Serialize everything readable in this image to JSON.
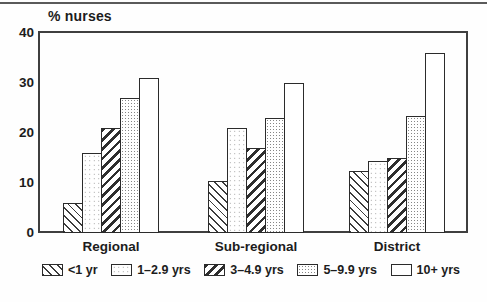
{
  "chart_data": {
    "type": "bar",
    "title": "% nurses",
    "ylabel": "% nurses",
    "xlabel": "",
    "ylim": [
      0,
      40
    ],
    "yticks": [
      0,
      10,
      20,
      30,
      40
    ],
    "grid": false,
    "legend_position": "bottom",
    "categories": [
      "Regional",
      "Sub-regional",
      "District"
    ],
    "series": [
      {
        "name": "<1 yr",
        "pattern": "hatch-back",
        "values": [
          6,
          10.5,
          12.5
        ]
      },
      {
        "name": "1–2.9 yrs",
        "pattern": "dots-sparse",
        "values": [
          16,
          21,
          14.5
        ]
      },
      {
        "name": "3–4.9 yrs",
        "pattern": "hatch-heavy",
        "values": [
          21,
          17,
          15
        ]
      },
      {
        "name": "5–9.9 yrs",
        "pattern": "dots-dense",
        "values": [
          27,
          23,
          23.5
        ]
      },
      {
        "name": "10+ yrs",
        "pattern": "plain",
        "values": [
          31,
          30,
          36
        ]
      }
    ]
  },
  "colors": {
    "ink": "#1c1c1c",
    "frame": "#3f3f3f",
    "background": "#ffffff"
  }
}
